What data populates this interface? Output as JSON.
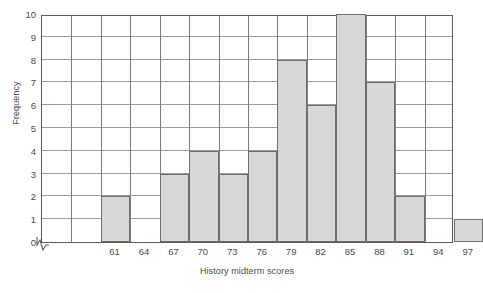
{
  "chart_data": {
    "type": "bar",
    "title": "",
    "subtitle": "",
    "xlabel": "History midterm scores",
    "ylabel": "Frequency",
    "categories": [
      "61",
      "64",
      "67",
      "70",
      "73",
      "76",
      "79",
      "82",
      "85",
      "88",
      "91",
      "94",
      "97"
    ],
    "values": [
      2,
      0,
      3,
      4,
      3,
      4,
      8,
      6,
      10,
      7,
      2,
      0,
      1
    ],
    "ylim": [
      0,
      10
    ],
    "y_ticks": [
      0,
      1,
      2,
      3,
      4,
      5,
      6,
      7,
      8,
      9,
      10
    ],
    "x_ticks": [
      "61",
      "64",
      "67",
      "70",
      "73",
      "76",
      "79",
      "82",
      "85",
      "88",
      "91",
      "94",
      "97"
    ],
    "grid": true,
    "legend": "none",
    "axis_break": true,
    "bar_color": "#d7d7d7",
    "bar_border_color": "#6e6e6e",
    "grid_color": "#9a9a9a",
    "axis_color": "#5a5a5a",
    "text_color": "#4a4a4a",
    "empty_leading_columns": 2,
    "total_columns": 14,
    "annotations": []
  }
}
